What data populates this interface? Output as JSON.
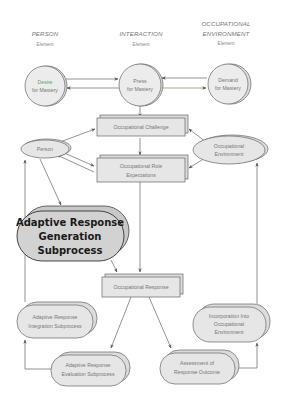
{
  "headers": {
    "person": {
      "title": "PERSON",
      "subtitle": "Element"
    },
    "interaction": {
      "title": "INTERACTION",
      "subtitle": "Element"
    },
    "environment": {
      "title_line1": "OCCUPATIONAL",
      "title_line2": "ENVIRONMENT",
      "subtitle": "Element"
    }
  },
  "nodes": {
    "desire": {
      "line1": "Desire",
      "line2": "for Mastery"
    },
    "press": {
      "line1": "Press",
      "line2": "for Mastery"
    },
    "demand": {
      "line1": "Demand",
      "line2": "for Mastery"
    },
    "challenge": {
      "label": "Occupational Challenge"
    },
    "person": {
      "label": "Person"
    },
    "environment": {
      "line1": "Occupational",
      "line2": "Environment"
    },
    "role": {
      "line1": "Occupational Role",
      "line2": "Expectations"
    },
    "generation": {
      "line1": "Adaptive Response",
      "line2": "Generation",
      "line3": "Subprocess"
    },
    "response": {
      "label": "Occupational Response"
    },
    "integration": {
      "line1": "Adaptive Response",
      "line2": "Integration Subprocess"
    },
    "incorporation": {
      "line1": "Incorporation Into",
      "line2": "Occupational",
      "line3": "Environment"
    },
    "evaluation": {
      "line1": "Adaptive Response",
      "line2": "Evaluation Subprocess"
    },
    "assessment": {
      "line1": "Assessment of",
      "line2": "Response Outcome"
    }
  },
  "colors": {
    "node_fill": "#e6e6e6",
    "stroke": "#666666",
    "desire_text": "#6f9a6f",
    "generation_fill": "#d2d2d2",
    "arrow_tint": "#7a8a5a"
  }
}
